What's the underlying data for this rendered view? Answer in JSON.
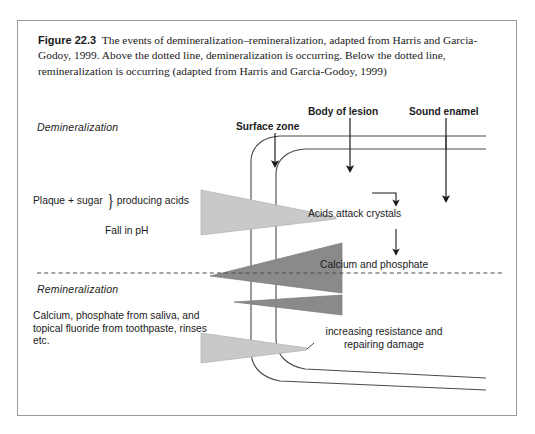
{
  "caption": {
    "figure_label": "Figure 22.3",
    "text": "The events of demineralization–remineralization, adapted from Harris and Garcia-Godoy, 1999. Above the dotted line, demineralization is occurring. Below the dotted line, remineralization is occurring (adapted from Harris and Garcia-Godoy, 1999)"
  },
  "diagram": {
    "zone_labels": {
      "demineralization": "Demineralization",
      "remineralization": "Remineralization"
    },
    "top_labels": [
      {
        "name": "surface-zone",
        "text": "Surface zone"
      },
      {
        "name": "body-of-lesion",
        "text": "Body of lesion"
      },
      {
        "name": "sound-enamel",
        "text": "Sound enamel"
      }
    ],
    "left_inputs": {
      "plaque": "Plaque + sugar",
      "brace": "}",
      "producing_acids": "producing acids",
      "fall_in_ph": "Fall in pH",
      "remin_sources": "Calcium, phosphate from saliva, and topical fluoride from toothpaste, rinses etc."
    },
    "process_steps": [
      {
        "name": "acids-attack-crystals",
        "text": "Acids attack crystals"
      },
      {
        "name": "calcium-and-phosphate",
        "text": "Calcium and phosphate"
      },
      {
        "name": "increasing-resistance",
        "text": "increasing resistance and repairing damage"
      }
    ],
    "colors": {
      "light_wedge": "#c9c9c9",
      "dark_wedge": "#8a8a8a",
      "line": "#4a4a4a",
      "border": "#9a9a9a",
      "text": "#1b1b1b"
    },
    "divider": {
      "name": "dotted-divider",
      "style": "dashed"
    }
  }
}
